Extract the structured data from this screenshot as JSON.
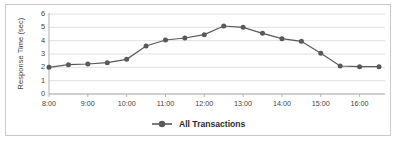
{
  "chart_data": {
    "type": "line",
    "title": "",
    "xlabel": "",
    "ylabel": "Response Time (sec)",
    "ylim": [
      0,
      6
    ],
    "y_ticks": [
      "0",
      "1",
      "2",
      "3",
      "4",
      "5",
      "6"
    ],
    "grid": true,
    "legend_position": "bottom",
    "x_tick_labels": [
      "8:00",
      "9:00",
      "10:00",
      "11:00",
      "12:00",
      "13:00",
      "14:00",
      "15:00",
      "16:00"
    ],
    "x": [
      "8:00",
      "8:30",
      "9:00",
      "9:30",
      "10:00",
      "10:30",
      "11:00",
      "11:30",
      "12:00",
      "12:30",
      "13:00",
      "13:30",
      "14:00",
      "14:30",
      "15:00",
      "15:30",
      "16:00",
      "16:30"
    ],
    "series": [
      {
        "name": "All Transactions",
        "color": "#595959",
        "marker": "circle",
        "values": [
          2.0,
          2.2,
          2.25,
          2.35,
          2.6,
          3.6,
          4.05,
          4.2,
          4.45,
          5.1,
          5.0,
          4.55,
          4.15,
          3.95,
          3.05,
          2.1,
          2.05,
          2.05
        ]
      }
    ]
  },
  "legend": {
    "entries": [
      {
        "label": "All Transactions",
        "color": "#595959"
      }
    ]
  },
  "colors": {
    "line": "#595959",
    "marker": "#595959",
    "grid": "#d9d9d9",
    "axis": "#a6a6a6",
    "border": "#c9c9c9",
    "text": "#3f3f3f",
    "background": "#ffffff"
  }
}
